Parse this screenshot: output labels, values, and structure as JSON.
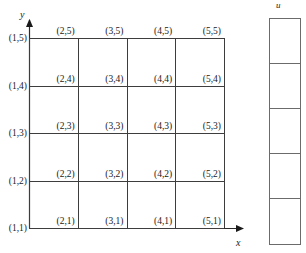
{
  "figure": {
    "axes": {
      "x_label": "x",
      "y_label": "y"
    },
    "right_column": {
      "label": "u",
      "cell_count": 5,
      "cells": [
        "",
        "",
        "",
        "",
        ""
      ]
    }
  },
  "chart_data": {
    "type": "diagram",
    "title": "",
    "xlabel": "x",
    "ylabel": "y",
    "grid": true,
    "columns": 4,
    "rows": 4,
    "node_columns": 5,
    "node_rows": 5,
    "row_axis_labels": [
      "(1,5)",
      "(1,4)",
      "(1,3)",
      "(1,2)",
      "(1,1)"
    ],
    "node_labels": [
      [
        "(2,5)",
        "(3,5)",
        "(4,5)",
        "(5,5)"
      ],
      [
        "(2,4)",
        "(3,4)",
        "(4,4)",
        "(5,4)"
      ],
      [
        "(2,3)",
        "(3,3)",
        "(4,3)",
        "(5,3)"
      ],
      [
        "(2,2)",
        "(3,2)",
        "(4,2)",
        "(5,2)"
      ],
      [
        "(2,1)",
        "(3,1)",
        "(4,1)",
        "(5,1)"
      ]
    ],
    "colors": {
      "grid_line": "#3d3d3d",
      "axis": "#2b2b2b",
      "column_border": "#6b6b6b",
      "text": "#1a1a1a",
      "background": "#ffffff"
    }
  }
}
